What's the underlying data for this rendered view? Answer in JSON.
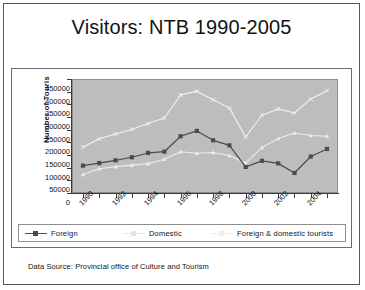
{
  "slide": {
    "title": "Visitors: NTB 1990-2005",
    "footer": "Data Source: Provincial office of Culture and Tourism"
  },
  "chart_data": {
    "type": "line",
    "title": "Visitors: NTB 1990-2005",
    "xlabel": "",
    "ylabel": "Number of Touris",
    "ylim": [
      0,
      450000
    ],
    "ytick_labels": [
      "450000",
      "400000",
      "350000",
      "300000",
      "250000",
      "200000",
      "150000",
      "100000",
      "50000",
      "0"
    ],
    "ytick_values": [
      450000,
      400000,
      350000,
      300000,
      250000,
      200000,
      150000,
      100000,
      50000,
      0
    ],
    "grid": false,
    "legend_position": "bottom",
    "x": [
      1990,
      1991,
      1992,
      1993,
      1994,
      1995,
      1996,
      1997,
      1998,
      1999,
      2000,
      2001,
      2002,
      2003,
      2004,
      2005
    ],
    "xtick_labels": [
      "1990",
      "1992",
      "1994",
      "1996",
      "1998",
      "2000",
      "2002",
      "2004"
    ],
    "xtick_values": [
      1990,
      1992,
      1994,
      1996,
      1998,
      2000,
      2002,
      2004
    ],
    "series": [
      {
        "name": "Foreign",
        "color": "#4c4c4c",
        "marker": "square",
        "values": [
          108000,
          118000,
          129000,
          141000,
          158000,
          163000,
          224000,
          245000,
          208000,
          188000,
          103000,
          127000,
          117000,
          79000,
          144000,
          174000
        ]
      },
      {
        "name": "Domestic",
        "color": "#ececec",
        "marker": "triangle",
        "values": [
          73000,
          96000,
          104000,
          110000,
          116000,
          133000,
          163000,
          157000,
          160000,
          148000,
          118000,
          180000,
          215000,
          237000,
          227000,
          224000
        ]
      },
      {
        "name": "Foreign & domestic tourists",
        "color": "#f2f2f2",
        "marker": "x",
        "values": [
          181000,
          214000,
          233000,
          251000,
          274000,
          296000,
          387000,
          402000,
          368000,
          336000,
          221000,
          307000,
          332000,
          316000,
          371000,
          404000
        ]
      }
    ]
  },
  "legend": {
    "items": [
      {
        "label": "Foreign",
        "color": "#4c4c4c"
      },
      {
        "label": "Domestic",
        "color": "#e4e4e4"
      },
      {
        "label": "Foreign & domestic tourists",
        "color": "#ededed"
      }
    ]
  },
  "colors": {
    "plot_background": "#bdbdbd",
    "slide_border": "#58585a",
    "axis": "#3a3a3a"
  }
}
